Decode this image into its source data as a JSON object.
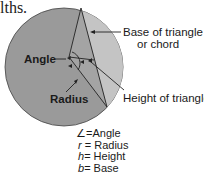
{
  "page_fragment": "lths.",
  "labels": {
    "angle": "Angle",
    "radius": "Radius",
    "base": "Base of triangle",
    "base_line2": "or chord",
    "height": "Height of triangle"
  },
  "legend": [
    {
      "symbol": "∠",
      "text": "=Angle"
    },
    {
      "symbol": "r",
      "text": " = Radius"
    },
    {
      "symbol": "h",
      "text": "= Height"
    },
    {
      "symbol": "b",
      "text": "= Base"
    }
  ],
  "colors": {
    "circle_fill": "#9a9a9a",
    "segment_fill": "#c4c4c4",
    "triangle_fill": "#a8a8a8",
    "stroke": "#222222"
  }
}
